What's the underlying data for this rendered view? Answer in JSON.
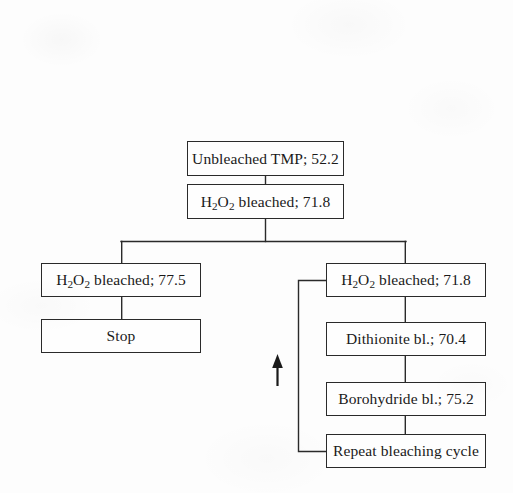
{
  "diagram": {
    "line_color": "#2a2a2a",
    "background": "#fdfdfd",
    "nodes": [
      {
        "id": "unbleached",
        "label": "Unbleached TMP; 52.2",
        "text_plain": "Unbleached TMP; 52.2",
        "value": 52.2,
        "x": 187,
        "y": 141,
        "w": 157,
        "h": 35
      },
      {
        "id": "h2o2_first",
        "label": "H<sub>2</sub>O<sub>2</sub> bleached; 71.8",
        "text_plain": "H2O2 bleached; 71.8",
        "value": 71.8,
        "x": 187,
        "y": 184,
        "w": 157,
        "h": 35
      },
      {
        "id": "h2o2_left",
        "label": "H<sub>2</sub>O<sub>2</sub> bleached; 77.5",
        "text_plain": "H2O2 bleached; 77.5",
        "value": 77.5,
        "x": 41,
        "y": 263,
        "w": 160,
        "h": 34
      },
      {
        "id": "stop",
        "label": "Stop",
        "text_plain": "Stop",
        "value": null,
        "x": 41,
        "y": 319,
        "w": 160,
        "h": 34
      },
      {
        "id": "h2o2_right",
        "label": "H<sub>2</sub>O<sub>2</sub> bleached; 71.8",
        "text_plain": "H2O2 bleached; 71.8",
        "value": 71.8,
        "x": 326,
        "y": 263,
        "w": 160,
        "h": 34
      },
      {
        "id": "dithionite",
        "label": "Dithionite bl.; 70.4",
        "text_plain": "Dithionite bl.; 70.4",
        "value": 70.4,
        "x": 326,
        "y": 322,
        "w": 160,
        "h": 34
      },
      {
        "id": "borohydride",
        "label": "Borohydride bl.; 75.2",
        "text_plain": "Borohydride bl.; 75.2",
        "value": 75.2,
        "x": 326,
        "y": 382,
        "w": 160,
        "h": 34
      },
      {
        "id": "repeat",
        "label": "Repeat bleaching cycle",
        "text_plain": "Repeat bleaching cycle",
        "value": null,
        "x": 326,
        "y": 434,
        "w": 160,
        "h": 34
      }
    ],
    "edges": [
      {
        "id": "edge-unbleached-to-h2o2first",
        "from": "unbleached",
        "to": "h2o2_first",
        "kind": "vertical"
      },
      {
        "id": "edge-h2o2first-to-split",
        "from": "h2o2_first",
        "to": "split-bar",
        "kind": "vertical"
      },
      {
        "id": "edge-split-to-left",
        "from": "split-bar",
        "to": "h2o2_left",
        "kind": "elbow"
      },
      {
        "id": "edge-split-to-right",
        "from": "split-bar",
        "to": "h2o2_right",
        "kind": "elbow"
      },
      {
        "id": "edge-left-to-stop",
        "from": "h2o2_left",
        "to": "stop",
        "kind": "vertical"
      },
      {
        "id": "edge-right-to-dithionite",
        "from": "h2o2_right",
        "to": "dithionite",
        "kind": "vertical"
      },
      {
        "id": "edge-dithionite-to-borohydride",
        "from": "dithionite",
        "to": "borohydride",
        "kind": "vertical"
      },
      {
        "id": "edge-borohydride-to-repeat",
        "from": "borohydride",
        "to": "repeat",
        "kind": "vertical"
      },
      {
        "id": "edge-repeat-loopback",
        "from": "repeat",
        "to": "h2o2_right",
        "kind": "loopback"
      }
    ],
    "arrow": {
      "id": "cycle-direction-arrow",
      "direction": "up",
      "x": 277,
      "y_top": 355,
      "y_bottom": 386
    }
  }
}
